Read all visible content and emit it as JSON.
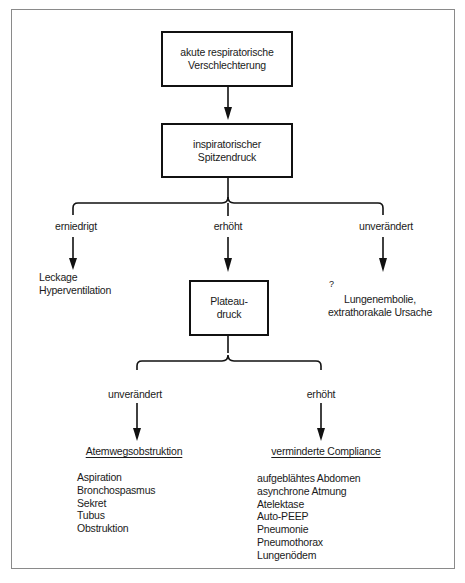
{
  "nodes": {
    "start": {
      "line1": "akute respiratorische",
      "line2": "Verschlechterung"
    },
    "peak": {
      "line1": "inspiratorischer",
      "line2": "Spitzendruck"
    },
    "plateau": {
      "line1": "Plateau-",
      "line2": "druck"
    }
  },
  "peak_branches": {
    "left": {
      "label": "erniedrigt",
      "result": [
        "Leckage",
        "Hyperventilation"
      ]
    },
    "middle": {
      "label": "erhöht"
    },
    "right": {
      "label": "unverändert",
      "question_mark": "?",
      "result": [
        "Lungenembolie,",
        "extrathorakale Ursache"
      ]
    }
  },
  "plateau_branches": {
    "left": {
      "label": "unverändert",
      "heading": "Atemwegsobstruktion",
      "items": [
        "Aspiration",
        "Bronchospasmus",
        "Sekret",
        "Tubus",
        "Obstruktion"
      ]
    },
    "right": {
      "label": "erhöht",
      "heading": "verminderte Compliance",
      "items": [
        "aufgeblähtes Abdomen",
        "asynchrone Atmung",
        "Atelektase",
        "Auto-PEEP",
        "Pneumonie",
        "Pneumothorax",
        "Lungenödem"
      ]
    }
  }
}
